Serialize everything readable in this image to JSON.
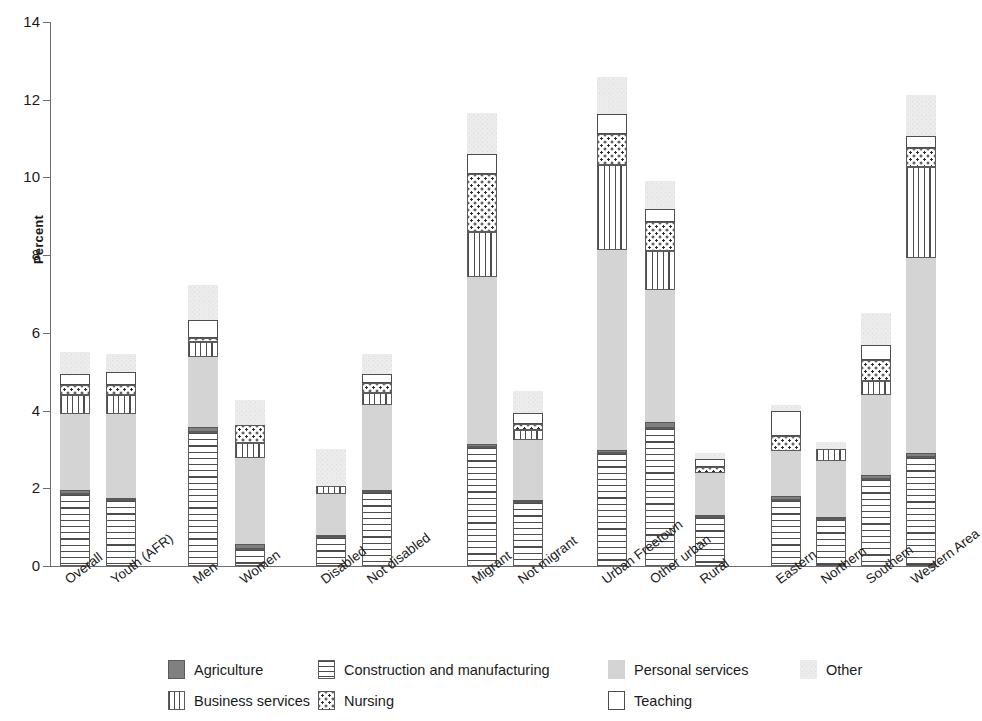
{
  "chart_data": {
    "type": "bar",
    "subtype": "stacked-bar",
    "title": "",
    "xlabel": "",
    "ylabel": "Percent",
    "ylim": [
      0,
      14
    ],
    "yticks": [
      0,
      2,
      4,
      6,
      8,
      10,
      12,
      14
    ],
    "ytick_labels": [
      "0",
      "2",
      "4",
      "6",
      "8",
      "10",
      "12",
      "14"
    ],
    "grid": false,
    "legend_position": "bottom",
    "stacking_order": [
      "Construction and manufacturing",
      "Agriculture",
      "Personal services",
      "Business services",
      "Nursing",
      "Teaching",
      "Other"
    ],
    "categories": [
      "Overall",
      "Youth (AFR)",
      "Men",
      "Women",
      "Disabled",
      "Not disabled",
      "Migrant",
      "Not migrant",
      "Urban Freetown",
      "Other urban",
      "Rural",
      "Eastern",
      "Northern",
      "Southern",
      "Western Area"
    ],
    "groups": [
      {
        "name": "Total",
        "categories": [
          "Overall",
          "Youth (AFR)"
        ]
      },
      {
        "name": "Sex",
        "categories": [
          "Men",
          "Women"
        ]
      },
      {
        "name": "Disability",
        "categories": [
          "Disabled",
          "Not disabled"
        ]
      },
      {
        "name": "Migration",
        "categories": [
          "Migrant",
          "Not migrant"
        ]
      },
      {
        "name": "Location",
        "categories": [
          "Urban Freetown",
          "Other urban",
          "Rural"
        ]
      },
      {
        "name": "Region",
        "categories": [
          "Eastern",
          "Northern",
          "Southern",
          "Western Area"
        ]
      }
    ],
    "series": [
      {
        "name": "Construction and manufacturing",
        "pattern": "horizontal-lines",
        "color": "#ffffff",
        "values": [
          1.85,
          1.7,
          3.45,
          0.45,
          0.75,
          1.9,
          3.05,
          1.65,
          2.9,
          3.55,
          1.25,
          1.7,
          1.2,
          2.25,
          2.8
        ]
      },
      {
        "name": "Agriculture",
        "pattern": "solid-dark",
        "color": "#808080",
        "values": [
          0.1,
          0.05,
          0.12,
          0.12,
          0.05,
          0.05,
          0.1,
          0.05,
          0.08,
          0.15,
          0.05,
          0.1,
          0.05,
          0.1,
          0.12
        ]
      },
      {
        "name": "Personal services",
        "pattern": "light-stipple",
        "color": "#d4d4d4",
        "values": [
          1.95,
          2.15,
          1.8,
          2.2,
          1.05,
          2.2,
          4.3,
          1.55,
          5.15,
          3.4,
          1.1,
          1.15,
          1.45,
          2.05,
          5.0
        ]
      },
      {
        "name": "Business services",
        "pattern": "vertical-lines",
        "color": "#ffffff",
        "values": [
          0.5,
          0.5,
          0.4,
          0.4,
          0.2,
          0.3,
          1.15,
          0.25,
          2.2,
          1.0,
          0.0,
          0.0,
          0.3,
          0.35,
          2.35
        ]
      },
      {
        "name": "Nursing",
        "pattern": "dotted",
        "color": "#ffffff",
        "values": [
          0.25,
          0.25,
          0.1,
          0.45,
          0.0,
          0.25,
          1.5,
          0.15,
          0.8,
          0.75,
          0.15,
          0.4,
          0.0,
          0.55,
          0.5
        ]
      },
      {
        "name": "Teaching",
        "pattern": "white",
        "color": "#ffffff",
        "values": [
          0.3,
          0.35,
          0.45,
          0.0,
          0.0,
          0.25,
          0.5,
          0.3,
          0.5,
          0.35,
          0.2,
          0.65,
          0.0,
          0.4,
          0.3
        ]
      },
      {
        "name": "Other",
        "pattern": "faint-stipple",
        "color": "#ececec",
        "values": [
          0.55,
          0.45,
          0.9,
          0.65,
          0.95,
          0.5,
          1.05,
          0.55,
          0.95,
          0.7,
          0.15,
          0.15,
          0.2,
          0.8,
          1.05
        ]
      }
    ],
    "totals": [
      5.5,
      5.45,
      7.05,
      4.25,
      3.0,
      5.45,
      11.15,
      4.5,
      12.55,
      9.9,
      2.9,
      4.15,
      3.2,
      6.5,
      12.1
    ]
  },
  "axis": {
    "y_title": "Percent",
    "y_ticks": [
      "14",
      "12",
      "10",
      "8",
      "6",
      "4",
      "2",
      "0"
    ]
  },
  "legend": {
    "items": [
      {
        "label": "Agriculture",
        "swatch": "sw-agri",
        "icon": "agriculture-swatch-icon"
      },
      {
        "label": "Construction and manufacturing",
        "swatch": "sw-constr",
        "icon": "construction-swatch-icon"
      },
      {
        "label": "Personal services",
        "swatch": "sw-personal",
        "icon": "personal-services-swatch-icon"
      },
      {
        "label": "Other",
        "swatch": "sw-other",
        "icon": "other-swatch-icon"
      },
      {
        "label": "Business services",
        "swatch": "sw-business",
        "icon": "business-services-swatch-icon"
      },
      {
        "label": "Nursing",
        "swatch": "sw-nursing",
        "icon": "nursing-swatch-icon"
      },
      {
        "label": "Teaching",
        "swatch": "sw-teaching",
        "icon": "teaching-swatch-icon"
      }
    ],
    "layout": [
      {
        "index": 0,
        "left": 168,
        "top": 0
      },
      {
        "index": 1,
        "left": 318,
        "top": 0
      },
      {
        "index": 2,
        "left": 608,
        "top": 0
      },
      {
        "index": 3,
        "left": 800,
        "top": 0
      },
      {
        "index": 4,
        "left": 168,
        "top": 31
      },
      {
        "index": 5,
        "left": 318,
        "top": 31
      },
      {
        "index": 6,
        "left": 608,
        "top": 31
      }
    ]
  },
  "geometry": {
    "plot_left": 52,
    "plot_top": 22,
    "plot_bottom": 566,
    "bar_width": 30,
    "bar_x": [
      60,
      106,
      188,
      235,
      316,
      362,
      467,
      513,
      597,
      645,
      695,
      771,
      816,
      861,
      906
    ]
  }
}
